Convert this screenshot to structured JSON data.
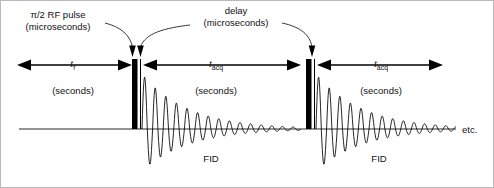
{
  "figure": {
    "type": "nmr-pulse-sequence-timing-diagram",
    "background_color": "#ffffff",
    "line_color": "#000000",
    "border_color": "#b9b9b9"
  },
  "labels": {
    "rf_pulse_title": "π/2 RF pulse",
    "rf_pulse_units": "(microseconds)",
    "delay_title": "delay",
    "delay_units": "(microseconds)",
    "tr_symbol": "t",
    "tr_subscript": "r",
    "tr_units": "(seconds)",
    "tacq_symbol": "t",
    "tacq_subscript": "acq",
    "tacq_units_1": "(seconds)",
    "tacq_units_2": "(seconds)",
    "fid_label_1": "FID",
    "fid_label_2": "FID",
    "etc_label": "etc."
  },
  "geometry": {
    "baseline_y": 128,
    "baseline_x_start": 18,
    "baseline_x_end": 455,
    "pulse_1_x": 131,
    "pulse_2_x": 305,
    "pulse_width": 5.5,
    "pulse_top_y": 58,
    "delay_line_1_x": 139.5,
    "delay_line_2_x": 313.5,
    "fid_1_start_x": 141,
    "fid_2_start_x": 315
  },
  "chart_data": {
    "type": "line",
    "title": "",
    "xlabel": "time",
    "ylabel": "signal",
    "grid": false,
    "legend": false,
    "series": [
      {
        "name": "FID 1",
        "envelope": "exponential-decay",
        "start_x": 141,
        "end_x": 300,
        "initial_amplitude_positive": 55,
        "initial_amplitude_negative": 42,
        "decay_constant_px": 46,
        "oscillation_period_px": 10.6,
        "cycles": 15
      },
      {
        "name": "FID 2",
        "envelope": "exponential-decay",
        "start_x": 315,
        "end_x": 455,
        "initial_amplitude_positive": 55,
        "initial_amplitude_negative": 42,
        "decay_constant_px": 46,
        "oscillation_period_px": 10.6,
        "cycles": 13
      }
    ],
    "events": [
      {
        "name": "pi/2 RF pulse 1",
        "x": 131,
        "duration": "microseconds"
      },
      {
        "name": "delay 1",
        "x": 139.5,
        "duration": "microseconds"
      },
      {
        "name": "pi/2 RF pulse 2",
        "x": 305,
        "duration": "microseconds"
      },
      {
        "name": "delay 2",
        "x": 313.5,
        "duration": "microseconds"
      }
    ],
    "intervals": [
      {
        "name": "t_r",
        "from_x": 22,
        "to_x": 128,
        "units": "seconds"
      },
      {
        "name": "t_acq",
        "from_x": 146,
        "to_x": 298,
        "units": "seconds"
      },
      {
        "name": "t_acq",
        "from_x": 320,
        "to_x": 440,
        "units": "seconds"
      }
    ]
  }
}
